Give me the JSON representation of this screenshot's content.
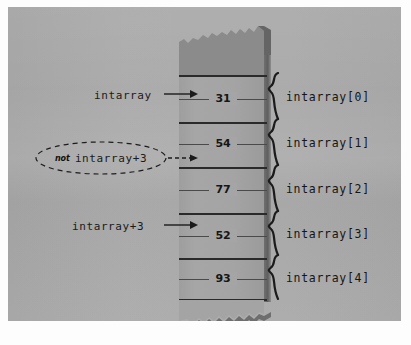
{
  "figure": {
    "colors": {
      "plate_background": "#a9a9a9",
      "column_fill": "#a4a4a4",
      "column_shadow_edge": "#5f5f5f",
      "unknown_memory_shade": "#8b8b8b",
      "ink": "#1b1b1b",
      "mat": "#fdfdfd"
    }
  },
  "memory_column": {
    "name": "memory-column",
    "cells": [
      {
        "index": 0,
        "value": "31"
      },
      {
        "index": 1,
        "value": "54"
      },
      {
        "index": 2,
        "value": "77"
      },
      {
        "index": 3,
        "value": "52"
      },
      {
        "index": 4,
        "value": "93"
      }
    ]
  },
  "left_labels": [
    {
      "id": "intarray",
      "text": "intarray",
      "arrow": "solid"
    },
    {
      "id": "intarray-plus-3",
      "text": "intarray+3",
      "arrow": "solid"
    }
  ],
  "callout": {
    "qualifier": "not",
    "text": "intarray+3",
    "arrow": "dashed",
    "shape": "dashed-ellipse"
  },
  "right_labels": [
    {
      "index": 0,
      "text": "intarray[0]"
    },
    {
      "index": 1,
      "text": "intarray[1]"
    },
    {
      "index": 2,
      "text": "intarray[2]"
    },
    {
      "index": 3,
      "text": "intarray[3]"
    },
    {
      "index": 4,
      "text": "intarray[4]"
    }
  ]
}
